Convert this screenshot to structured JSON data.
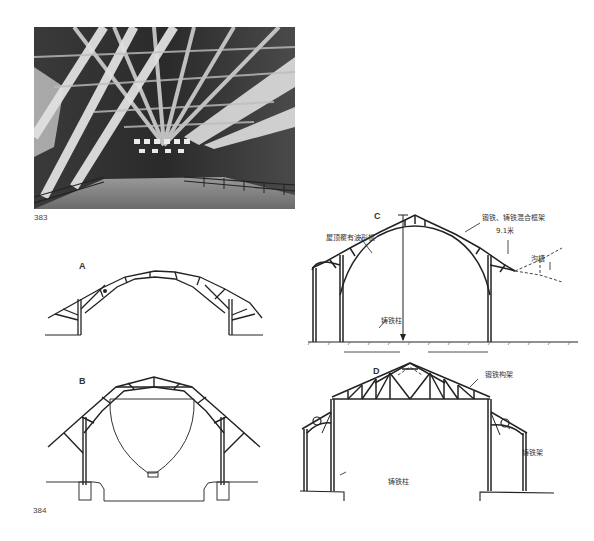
{
  "figures": {
    "photo": {
      "number": "383",
      "description": "Interior of timber-roofed shed with trusses and skylights"
    },
    "drawings": {
      "number": "384",
      "panels": [
        {
          "letter": "A",
          "labels": []
        },
        {
          "letter": "B",
          "labels": []
        },
        {
          "letter": "C",
          "labels": [
            "屋顶覆有波形板",
            "锻铁、铸铁混合框架",
            "9.1米",
            "沟槽",
            "铸铁柱"
          ]
        },
        {
          "letter": "D",
          "labels": [
            "锻铁构架",
            "铸铁架",
            "铸铁柱"
          ]
        }
      ]
    }
  },
  "labels": {
    "photo_number": "383",
    "drawing_number": "384",
    "a": "A",
    "b": "B",
    "c": "C",
    "d": "D",
    "c_roof": "屋顶覆有波形板",
    "c_frame": "锻铁、铸铁混合框架",
    "c_span": "9.1米",
    "c_gutter": "沟槽",
    "c_column": "铸铁柱",
    "d_truss": "锻铁构架",
    "d_bracket": "铸铁架",
    "d_column": "铸铁柱"
  }
}
